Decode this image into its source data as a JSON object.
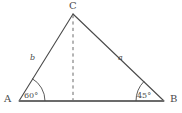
{
  "figure": {
    "kind": "geometry-diagram",
    "shape": "triangle",
    "background_color": "#ffffff",
    "stroke_color": "#4a4a4a",
    "base_stroke_color": "#6b6b6b",
    "width": 182,
    "height": 113
  },
  "vertices": {
    "C": {
      "label": "C",
      "x": 73,
      "y": 14
    },
    "A": {
      "label": "A",
      "x": 19,
      "y": 101
    },
    "B": {
      "label": "B",
      "x": 164,
      "y": 101
    }
  },
  "sides": {
    "b": {
      "label": "b",
      "from": "A",
      "to": "C"
    },
    "a": {
      "label": "a",
      "from": "C",
      "to": "B"
    },
    "base": {
      "label": "",
      "from": "A",
      "to": "B"
    }
  },
  "angles": {
    "at_A": {
      "label": "60°",
      "value": 60,
      "unit": "degrees"
    },
    "at_B": {
      "label": "45°",
      "value": 45,
      "unit": "degrees"
    }
  },
  "altitude": {
    "style": "dashed",
    "from": "C",
    "foot_x": 73,
    "foot_y": 101
  }
}
